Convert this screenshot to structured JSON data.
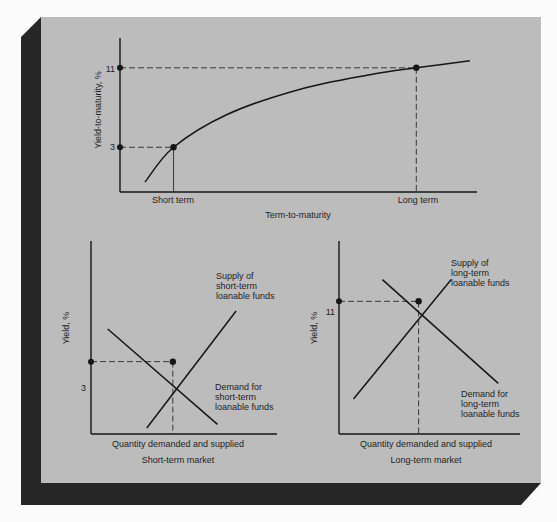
{
  "colors": {
    "panel": "#bcbcbc",
    "shadow": "#262626",
    "ink": "#161616",
    "background": "#fbfbfb"
  },
  "chart_data": [
    {
      "type": "line",
      "id": "yield-curve",
      "title": "",
      "xlabel": "Term-to-maturity",
      "ylabel": "Yield-to-maturity, %",
      "x_ticks": [
        {
          "label": "Short term",
          "x": 0.15
        },
        {
          "label": "Long term",
          "x": 0.83
        }
      ],
      "y_ticks": [
        {
          "label": "3",
          "y": 3
        },
        {
          "label": "11",
          "y": 11
        }
      ],
      "xlim": [
        0,
        1
      ],
      "ylim": [
        -1.5,
        14
      ],
      "series": [
        {
          "name": "Yield curve",
          "points": [
            [
              0.07,
              -0.5
            ],
            [
              0.15,
              3
            ],
            [
              0.3,
              6.3
            ],
            [
              0.5,
              8.8
            ],
            [
              0.7,
              10.3
            ],
            [
              0.83,
              11
            ],
            [
              0.98,
              11.7
            ]
          ]
        }
      ],
      "markers": [
        {
          "name": "short-term-point",
          "x": 0.15,
          "y": 3
        },
        {
          "name": "long-term-point",
          "x": 0.83,
          "y": 11
        }
      ],
      "grid": false
    },
    {
      "type": "line",
      "id": "short-term-market",
      "title": "Short-term market",
      "xlabel": "Quantity demanded and supplied",
      "ylabel": "Yield, %",
      "y_ticks": [
        {
          "label": "3",
          "y": 3
        }
      ],
      "xlim": [
        0,
        1
      ],
      "ylim": [
        0,
        8
      ],
      "series": [
        {
          "name": "Supply of short-term loanable funds",
          "points": [
            [
              0.3,
              0.25
            ],
            [
              0.78,
              5.1
            ]
          ]
        },
        {
          "name": "Demand for short-term loanable funds",
          "points": [
            [
              0.09,
              4.35
            ],
            [
              0.68,
              0.4
            ]
          ]
        }
      ],
      "markers": [
        {
          "name": "equilibrium",
          "x": 0.44,
          "y": 3
        }
      ],
      "annotations": [
        {
          "text": [
            "Supply of",
            "short-term",
            "loanable funds"
          ],
          "anchor": "supply-end"
        },
        {
          "text": [
            "Demand for",
            "short-term",
            "loanable funds"
          ],
          "anchor": "demand-end"
        }
      ],
      "grid": false
    },
    {
      "type": "line",
      "id": "long-term-market",
      "title": "Long-term market",
      "xlabel": "Quantity demanded and supplied",
      "ylabel": "Yield, %",
      "y_ticks": [
        {
          "label": "11",
          "y": 11
        }
      ],
      "xlim": [
        0,
        1
      ],
      "ylim": [
        0,
        16
      ],
      "series": [
        {
          "name": "Supply of long-term loanable funds",
          "points": [
            [
              0.08,
              2.9
            ],
            [
              0.62,
              12.8
            ]
          ]
        },
        {
          "name": "Demand for long-term loanable funds",
          "points": [
            [
              0.24,
              12.8
            ],
            [
              0.88,
              4.2
            ]
          ]
        }
      ],
      "markers": [
        {
          "name": "equilibrium",
          "x": 0.44,
          "y": 11
        }
      ],
      "annotations": [
        {
          "text": [
            "Supply of",
            "long-term",
            "loanable funds"
          ],
          "anchor": "supply-end"
        },
        {
          "text": [
            "Demand for",
            "long-term",
            "loanable funds"
          ],
          "anchor": "demand-end"
        }
      ],
      "grid": false
    }
  ]
}
